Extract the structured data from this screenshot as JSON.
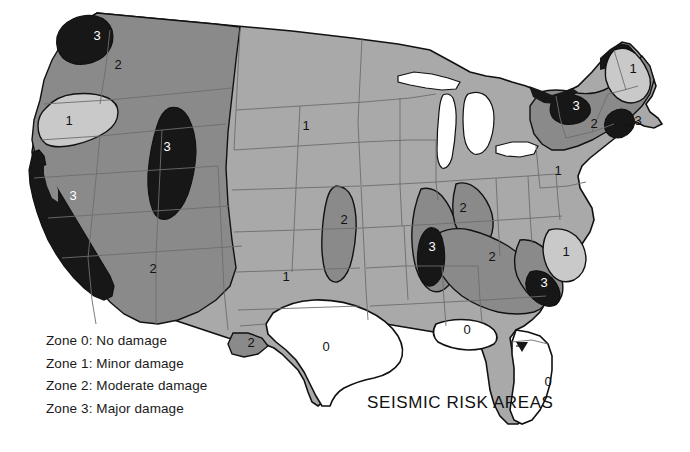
{
  "title": "SEISMIC RISK AREAS",
  "legend": {
    "rows": [
      "Zone 0: No damage",
      "Zone 1: Minor damage",
      "Zone 2: Moderate damage",
      "Zone 3: Major damage"
    ]
  },
  "colors": {
    "zone0": "#ffffff",
    "zone1_light": "#c9c9c9",
    "zone1": "#a9a9a9",
    "zone2": "#8a8a8a",
    "zone3": "#171717",
    "outline": "#111111",
    "state_border": "#6d6d6d",
    "label_dark": "#111111",
    "label_light": "#ffffff",
    "background": "#ffffff"
  },
  "map": {
    "name": "united-states-seismic-risk-map",
    "zone_labels": [
      {
        "id": "wa-puget-3",
        "text": "3",
        "x": 97,
        "y": 40,
        "tone": "light"
      },
      {
        "id": "pnw-2",
        "text": "2",
        "x": 118,
        "y": 69,
        "tone": "dark"
      },
      {
        "id": "pnw-inset-1",
        "text": "1",
        "x": 69,
        "y": 125,
        "tone": "dark"
      },
      {
        "id": "rockies-3",
        "text": "3",
        "x": 167,
        "y": 151,
        "tone": "light"
      },
      {
        "id": "california-3",
        "text": "3",
        "x": 73,
        "y": 200,
        "tone": "light"
      },
      {
        "id": "southwest-2",
        "text": "2",
        "x": 153,
        "y": 273,
        "tone": "dark"
      },
      {
        "id": "northplains-1",
        "text": "1",
        "x": 306,
        "y": 130,
        "tone": "dark"
      },
      {
        "id": "greatplains-2",
        "text": "2",
        "x": 344,
        "y": 224,
        "tone": "dark"
      },
      {
        "id": "southplains-1",
        "text": "1",
        "x": 286,
        "y": 281,
        "tone": "dark"
      },
      {
        "id": "westtexas-2",
        "text": "2",
        "x": 251,
        "y": 347,
        "tone": "dark"
      },
      {
        "id": "texas-0",
        "text": "0",
        "x": 326,
        "y": 351,
        "tone": "dark"
      },
      {
        "id": "newmadrid-3",
        "text": "3",
        "x": 432,
        "y": 251,
        "tone": "light"
      },
      {
        "id": "appalachia-2",
        "text": "2",
        "x": 463,
        "y": 212,
        "tone": "dark"
      },
      {
        "id": "southeast-2",
        "text": "2",
        "x": 492,
        "y": 261,
        "tone": "dark"
      },
      {
        "id": "charleston-3",
        "text": "3",
        "x": 544,
        "y": 287,
        "tone": "light"
      },
      {
        "id": "carolina-1",
        "text": "1",
        "x": 566,
        "y": 256,
        "tone": "dark"
      },
      {
        "id": "midatlantic-1",
        "text": "1",
        "x": 558,
        "y": 175,
        "tone": "dark"
      },
      {
        "id": "maine-1",
        "text": "1",
        "x": 633,
        "y": 73,
        "tone": "dark"
      },
      {
        "id": "adirondack-3",
        "text": "3",
        "x": 576,
        "y": 110,
        "tone": "light"
      },
      {
        "id": "newengland-2",
        "text": "2",
        "x": 594,
        "y": 128,
        "tone": "dark"
      },
      {
        "id": "capeann-3",
        "text": "3",
        "x": 638,
        "y": 125,
        "tone": "dark"
      },
      {
        "id": "gulf-0",
        "text": "0",
        "x": 467,
        "y": 334,
        "tone": "dark"
      },
      {
        "id": "florida-0",
        "text": "0",
        "x": 548,
        "y": 386,
        "tone": "dark"
      }
    ]
  }
}
